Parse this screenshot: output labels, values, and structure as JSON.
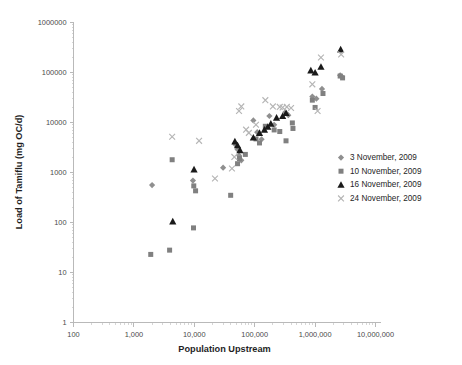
{
  "chart_data": {
    "type": "scatter",
    "title": "",
    "xlabel": "Population Upstream",
    "ylabel": "Load of Tamiflu (mg OC/d)",
    "xscale": "log",
    "yscale": "log",
    "xlim": [
      100,
      10000000
    ],
    "ylim": [
      1,
      1000000
    ],
    "grid": false,
    "legend_position": "right",
    "xticks": [
      100,
      1000,
      10000,
      100000,
      1000000,
      10000000
    ],
    "xtick_labels": [
      "100",
      "1,000",
      "10,000",
      "100,000",
      "1,000,000",
      "10,000,000"
    ],
    "yticks": [
      1,
      10,
      100,
      1000,
      10000,
      100000,
      1000000
    ],
    "ytick_labels": [
      "1",
      "10",
      "100",
      "1000",
      "10000",
      "100000",
      "1000000"
    ],
    "series": [
      {
        "name": "3 November, 2009",
        "marker": "diamond",
        "color": "#8f8f8f",
        "points": [
          [
            2000,
            560
          ],
          [
            9500,
            690
          ],
          [
            30000,
            1250
          ],
          [
            48000,
            3600
          ],
          [
            52000,
            2900
          ],
          [
            55000,
            2200
          ],
          [
            60000,
            1750
          ],
          [
            95000,
            11000
          ],
          [
            110000,
            6400
          ],
          [
            130000,
            4600
          ],
          [
            175000,
            13500
          ],
          [
            210000,
            9000
          ],
          [
            320000,
            16000
          ],
          [
            360000,
            14000
          ],
          [
            900000,
            33000
          ],
          [
            1050000,
            30000
          ],
          [
            1300000,
            47000
          ],
          [
            2600000,
            88000
          ],
          [
            2800000,
            82000
          ]
        ]
      },
      {
        "name": "10 November, 2009",
        "marker": "square",
        "color": "#808080",
        "points": [
          [
            1900,
            23
          ],
          [
            3900,
            28
          ],
          [
            4300,
            1800
          ],
          [
            9700,
            78
          ],
          [
            9800,
            540
          ],
          [
            10500,
            430
          ],
          [
            40000,
            350
          ],
          [
            52000,
            1500
          ],
          [
            56000,
            1900
          ],
          [
            70000,
            2300
          ],
          [
            105000,
            4700
          ],
          [
            120000,
            3900
          ],
          [
            150000,
            8400
          ],
          [
            210000,
            7100
          ],
          [
            260000,
            6600
          ],
          [
            330000,
            4300
          ],
          [
            420000,
            9800
          ],
          [
            430000,
            7600
          ],
          [
            900000,
            28000
          ],
          [
            1000000,
            20000
          ],
          [
            1350000,
            38000
          ],
          [
            2600000,
            85000
          ],
          [
            2850000,
            78000
          ]
        ]
      },
      {
        "name": "16 November, 2009",
        "marker": "triangle",
        "color": "#1a1a1a",
        "points": [
          [
            4400,
            105
          ],
          [
            9900,
            1150
          ],
          [
            47000,
            4200
          ],
          [
            52000,
            3500
          ],
          [
            57000,
            2800
          ],
          [
            95000,
            5000
          ],
          [
            120000,
            6200
          ],
          [
            145000,
            7200
          ],
          [
            165000,
            8200
          ],
          [
            185000,
            9500
          ],
          [
            230000,
            12500
          ],
          [
            290000,
            13500
          ],
          [
            330000,
            15500
          ],
          [
            850000,
            110000
          ],
          [
            1000000,
            100000
          ],
          [
            1250000,
            130000
          ],
          [
            2650000,
            290000
          ]
        ]
      },
      {
        "name": "24 November, 2009",
        "marker": "cross",
        "color": "#b5b5b5",
        "points": [
          [
            4300,
            5200
          ],
          [
            12000,
            4300
          ],
          [
            22000,
            760
          ],
          [
            42000,
            1200
          ],
          [
            46000,
            2050
          ],
          [
            55000,
            17000
          ],
          [
            60000,
            21000
          ],
          [
            72000,
            7200
          ],
          [
            80000,
            6200
          ],
          [
            105000,
            9000
          ],
          [
            150000,
            28000
          ],
          [
            200000,
            21000
          ],
          [
            260000,
            20500
          ],
          [
            290000,
            20000
          ],
          [
            340000,
            20500
          ],
          [
            400000,
            19500
          ],
          [
            900000,
            58000
          ],
          [
            1100000,
            17000
          ],
          [
            1250000,
            200000
          ],
          [
            2700000,
            230000
          ]
        ]
      }
    ]
  },
  "legend": {
    "items": [
      {
        "label": "3 November, 2009",
        "marker": "diamond",
        "color": "#8f8f8f"
      },
      {
        "label": "10 November, 2009",
        "marker": "square",
        "color": "#808080"
      },
      {
        "label": "16 November, 2009",
        "marker": "triangle",
        "color": "#1a1a1a"
      },
      {
        "label": "24 November, 2009",
        "marker": "cross",
        "color": "#b5b5b5"
      }
    ]
  }
}
